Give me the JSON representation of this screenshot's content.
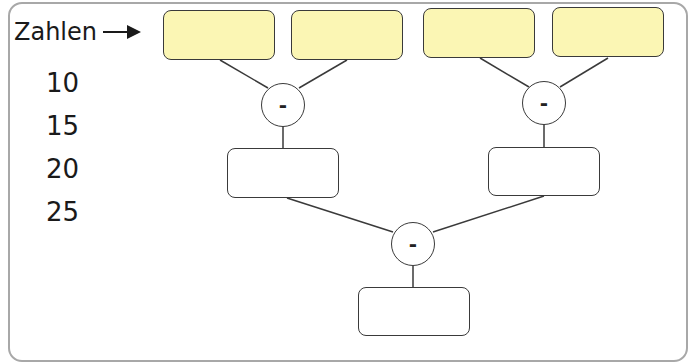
{
  "label": {
    "text": "Zahlen",
    "arrow": "arrow-right-icon"
  },
  "numbers": [
    "10",
    "15",
    "20",
    "25"
  ],
  "operators": {
    "top_left": "-",
    "top_right": "-",
    "bottom": "-"
  },
  "boxes": {
    "inputs": [
      "",
      "",
      "",
      ""
    ],
    "middle": [
      "",
      ""
    ],
    "result": ""
  },
  "colors": {
    "input_fill": "#fbf6b4",
    "stroke": "#3a3a3a",
    "frame": "#a8a8a8"
  }
}
